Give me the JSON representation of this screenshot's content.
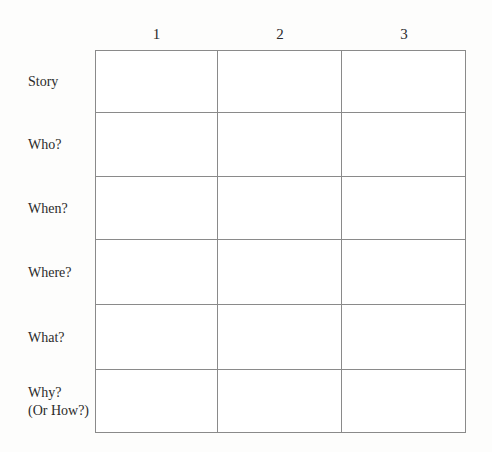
{
  "worksheet": {
    "background_color": "#fdfdfc",
    "border_color": "#8a8a8a",
    "text_color": "#2b2b2b",
    "column_headers": [
      "1",
      "2",
      "3"
    ],
    "row_labels": [
      "Story",
      "Who?",
      "When?",
      "Where?",
      "What?",
      "Why?\n(Or How?)"
    ],
    "cells": [
      [
        "",
        "",
        ""
      ],
      [
        "",
        "",
        ""
      ],
      [
        "",
        "",
        ""
      ],
      [
        "",
        "",
        ""
      ],
      [
        "",
        "",
        ""
      ],
      [
        "",
        "",
        ""
      ]
    ]
  }
}
